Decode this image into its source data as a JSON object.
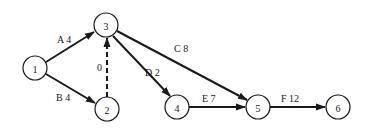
{
  "diagram": {
    "type": "activity-on-arrow network",
    "nodes": [
      {
        "id": "1",
        "label": "1",
        "x": 35,
        "y": 68
      },
      {
        "id": "2",
        "label": "2",
        "x": 107,
        "y": 109
      },
      {
        "id": "3",
        "label": "3",
        "x": 106,
        "y": 25
      },
      {
        "id": "4",
        "label": "4",
        "x": 177,
        "y": 107
      },
      {
        "id": "5",
        "label": "5",
        "x": 258,
        "y": 107
      },
      {
        "id": "6",
        "label": "6",
        "x": 338,
        "y": 107
      }
    ],
    "edges": [
      {
        "from": "1",
        "to": "3",
        "activity": "A",
        "duration": "4",
        "label": "A 4",
        "dummy": false
      },
      {
        "from": "1",
        "to": "2",
        "activity": "B",
        "duration": "4",
        "label": "B 4",
        "dummy": false
      },
      {
        "from": "2",
        "to": "3",
        "activity": "",
        "duration": "0",
        "label": "0",
        "dummy": true
      },
      {
        "from": "3",
        "to": "5",
        "activity": "C",
        "duration": "8",
        "label": "C 8",
        "dummy": false
      },
      {
        "from": "3",
        "to": "4",
        "activity": "D",
        "duration": "2",
        "label": "D 2",
        "dummy": false
      },
      {
        "from": "4",
        "to": "5",
        "activity": "E",
        "duration": "7",
        "label": "E 7",
        "dummy": false
      },
      {
        "from": "5",
        "to": "6",
        "activity": "F",
        "duration": "12",
        "label": "F 12",
        "dummy": false
      }
    ]
  }
}
